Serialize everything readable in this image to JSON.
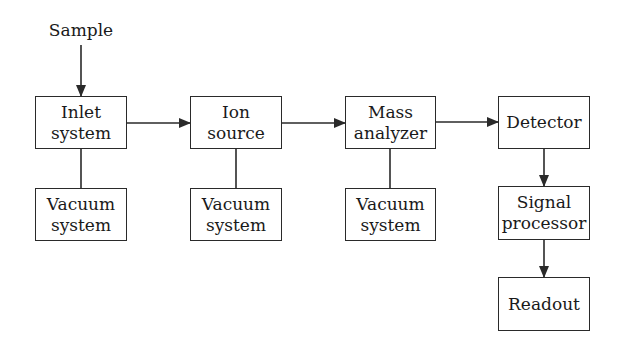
{
  "diagram": {
    "type": "block-diagram",
    "title": "",
    "input_label": "Sample",
    "nodes": [
      {
        "id": "inlet",
        "lines": [
          "Inlet",
          "system"
        ]
      },
      {
        "id": "ion",
        "lines": [
          "Ion",
          "source"
        ]
      },
      {
        "id": "mass",
        "lines": [
          "Mass",
          "analyzer"
        ]
      },
      {
        "id": "detector",
        "lines": [
          "Detector"
        ]
      },
      {
        "id": "vac1",
        "lines": [
          "Vacuum",
          "system"
        ]
      },
      {
        "id": "vac2",
        "lines": [
          "Vacuum",
          "system"
        ]
      },
      {
        "id": "vac3",
        "lines": [
          "Vacuum",
          "system"
        ]
      },
      {
        "id": "signal",
        "lines": [
          "Signal",
          "processor"
        ]
      },
      {
        "id": "readout",
        "lines": [
          "Readout"
        ]
      }
    ],
    "edges": [
      {
        "from": "Sample",
        "to": "inlet",
        "arrow": true
      },
      {
        "from": "inlet",
        "to": "ion",
        "arrow": true
      },
      {
        "from": "ion",
        "to": "mass",
        "arrow": true
      },
      {
        "from": "mass",
        "to": "detector",
        "arrow": true
      },
      {
        "from": "detector",
        "to": "signal",
        "arrow": true
      },
      {
        "from": "signal",
        "to": "readout",
        "arrow": true
      },
      {
        "from": "inlet",
        "to": "vac1",
        "arrow": false
      },
      {
        "from": "ion",
        "to": "vac2",
        "arrow": false
      },
      {
        "from": "mass",
        "to": "vac3",
        "arrow": false
      }
    ],
    "colors": {
      "stroke": "#2a2a2a",
      "background": "#ffffff",
      "text": "#1a1a1a"
    }
  }
}
